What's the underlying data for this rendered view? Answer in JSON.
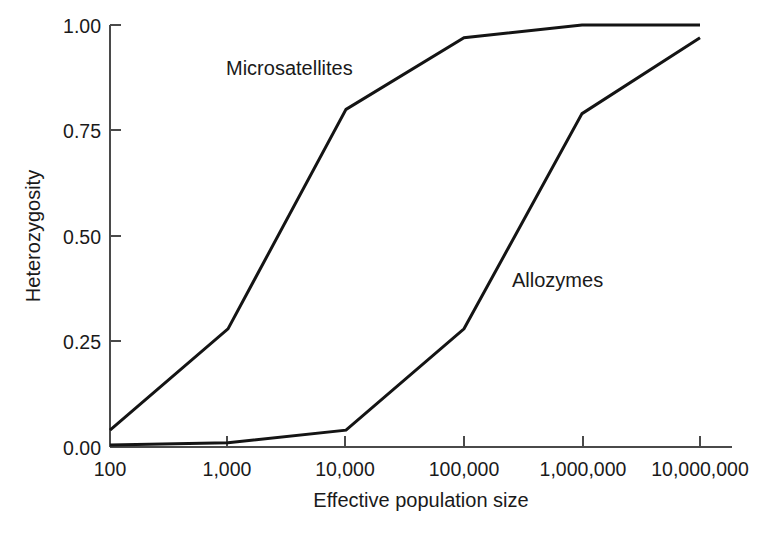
{
  "chart_data": {
    "type": "line",
    "title": "",
    "xlabel": "Effective population size",
    "ylabel": "Heterozygosity",
    "x": [
      100,
      1000,
      10000,
      100000,
      1000000,
      10000000
    ],
    "xtick_labels": [
      "100",
      "1,000",
      "10,000",
      "100,000",
      "1,000,000",
      "10,000,000"
    ],
    "ytick_labels": [
      "0.00",
      "0.25",
      "0.50",
      "0.75",
      "1.00"
    ],
    "ytick_values": [
      0.0,
      0.25,
      0.5,
      0.75,
      1.0
    ],
    "ylim": [
      0.0,
      1.0
    ],
    "xscale": "log",
    "grid": false,
    "legend_position": "inline-annotation",
    "series": [
      {
        "name": "Microsatellites",
        "values": [
          0.04,
          0.28,
          0.8,
          0.97,
          1.0,
          1.0
        ],
        "color": "#141414",
        "label_x": 10000,
        "label_y": 0.89
      },
      {
        "name": "Allozymes",
        "values": [
          0.005,
          0.01,
          0.04,
          0.28,
          0.79,
          0.97
        ],
        "color": "#141414",
        "label_x": 700000,
        "label_y": 0.42
      }
    ]
  },
  "figure": {
    "axis_color": "#4a4a4a",
    "line_color": "#141414",
    "background": "#ffffff",
    "ylabel": "Heterozygosity",
    "xlabel": "Effective population size",
    "series_label_microsatellites": "Microsatellites",
    "series_label_allozymes": "Allozymes",
    "ytick_0": "0.00",
    "ytick_1": "0.25",
    "ytick_2": "0.50",
    "ytick_3": "0.75",
    "ytick_4": "1.00",
    "xtick_0": "100",
    "xtick_1": "1,000",
    "xtick_2": "10,000",
    "xtick_3": "100,000",
    "xtick_4": "1,000,000",
    "xtick_5": "10,000,000"
  }
}
